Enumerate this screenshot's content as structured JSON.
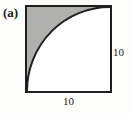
{
  "figure": {
    "label": "(a)",
    "type": "geometry-diagram",
    "square": {
      "side_right_label": "10",
      "side_bottom_label": "10"
    },
    "colors": {
      "shaded_region": "#b0b0ae",
      "outline": "#1f1f1f",
      "interior": "#ffffff",
      "background": "#fcfcfa",
      "text": "#1c1c1c"
    }
  }
}
